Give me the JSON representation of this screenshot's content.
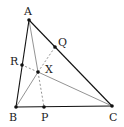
{
  "diagram": {
    "points": {
      "A": {
        "label": "A",
        "x": 29,
        "y": 20,
        "lx": 24,
        "ly": 15
      },
      "B": {
        "label": "B",
        "x": 16,
        "y": 107,
        "lx": 9,
        "ly": 121
      },
      "C": {
        "label": "C",
        "x": 112,
        "y": 106,
        "lx": 109,
        "ly": 121
      },
      "P": {
        "label": "P",
        "x": 44,
        "y": 107,
        "lx": 41,
        "ly": 121
      },
      "Q": {
        "label": "Q",
        "x": 55,
        "y": 47,
        "lx": 58,
        "ly": 46
      },
      "R": {
        "label": "R",
        "x": 22,
        "y": 65,
        "lx": 10,
        "ly": 65
      },
      "X": {
        "label": "X",
        "x": 38,
        "y": 72,
        "lx": 45,
        "ly": 73
      }
    },
    "colors": {
      "side": "#111111",
      "cevian": "#777777",
      "point": "#111111",
      "label": "#222222"
    }
  }
}
